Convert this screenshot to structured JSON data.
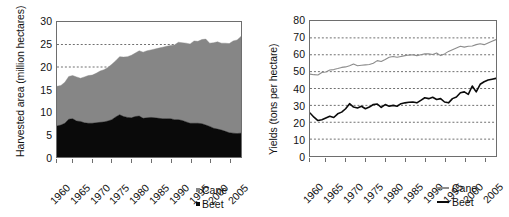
{
  "figure": {
    "panels": [
      {
        "id": "harvested-area",
        "ylabel": "Harvested area (million hectares)",
        "legend": [
          {
            "label": "Cane",
            "color": "#868686"
          },
          {
            "label": "Beet",
            "color": "#0a0a0a"
          }
        ]
      },
      {
        "id": "yields",
        "ylabel": "Yields (tons per hectare)",
        "legend": [
          {
            "label": "Cane",
            "color": "#8c8c8c"
          },
          {
            "label": "Beet",
            "color": "#0a0a0a"
          }
        ]
      }
    ]
  },
  "chart_data": [
    {
      "type": "area",
      "title": "",
      "stacked": true,
      "xlabel": "",
      "ylabel": "Harvested area (million hectares)",
      "ylim": [
        0,
        30
      ],
      "yticks": [
        0,
        5,
        10,
        15,
        20,
        25,
        30
      ],
      "gridlines": [
        20,
        25
      ],
      "grid": true,
      "xlim": [
        1961,
        2008
      ],
      "xticks": [
        1960,
        1965,
        1970,
        1975,
        1980,
        1985,
        1990,
        1995,
        2000,
        2005
      ],
      "legend_position": "bottom-right",
      "x": [
        1961,
        1962,
        1963,
        1964,
        1965,
        1966,
        1967,
        1968,
        1969,
        1970,
        1971,
        1972,
        1973,
        1974,
        1975,
        1976,
        1977,
        1978,
        1979,
        1980,
        1981,
        1982,
        1983,
        1984,
        1985,
        1986,
        1987,
        1988,
        1989,
        1990,
        1991,
        1992,
        1993,
        1994,
        1995,
        1996,
        1997,
        1998,
        1999,
        2000,
        2001,
        2002,
        2003,
        2004,
        2005,
        2006,
        2007,
        2008
      ],
      "series": [
        {
          "name": "Beet",
          "color": "#0a0a0a",
          "values": [
            6.9,
            7.1,
            7.5,
            8.4,
            8.5,
            8.0,
            7.9,
            7.6,
            7.5,
            7.5,
            7.6,
            7.7,
            7.8,
            8.0,
            8.3,
            8.9,
            9.4,
            9.0,
            8.8,
            8.7,
            9.0,
            9.1,
            8.6,
            8.7,
            8.8,
            8.7,
            8.6,
            8.5,
            8.5,
            8.5,
            8.3,
            8.3,
            8.1,
            7.8,
            7.5,
            7.5,
            7.5,
            7.4,
            7.1,
            6.8,
            6.4,
            6.2,
            6.0,
            5.7,
            5.4,
            5.3,
            5.2,
            5.3
          ]
        },
        {
          "name": "Cane",
          "color": "#868686",
          "values": [
            8.8,
            8.8,
            9.1,
            9.5,
            9.6,
            9.8,
            9.6,
            10.2,
            10.6,
            10.7,
            11.0,
            11.4,
            11.6,
            11.9,
            12.3,
            12.5,
            12.9,
            13.2,
            13.5,
            13.9,
            14.1,
            14.5,
            14.7,
            14.9,
            15.0,
            15.3,
            15.6,
            15.9,
            16.1,
            16.3,
            16.6,
            17.2,
            17.3,
            17.5,
            17.6,
            18.3,
            18.2,
            18.7,
            19.1,
            18.5,
            19.0,
            19.4,
            19.3,
            19.6,
            19.8,
            20.5,
            20.8,
            21.5
          ]
        }
      ]
    },
    {
      "type": "line",
      "title": "",
      "xlabel": "",
      "ylabel": "Yields (tons per hectare)",
      "ylim": [
        0,
        80
      ],
      "yticks": [
        0,
        10,
        20,
        30,
        40,
        50,
        60,
        70,
        80
      ],
      "gridlines": [
        10,
        20,
        30,
        40,
        50,
        60,
        70
      ],
      "grid": true,
      "xlim": [
        1961,
        2008
      ],
      "xticks": [
        1960,
        1965,
        1970,
        1975,
        1980,
        1985,
        1990,
        1995,
        2000,
        2005
      ],
      "legend_position": "bottom-right",
      "x": [
        1961,
        1962,
        1963,
        1964,
        1965,
        1966,
        1967,
        1968,
        1969,
        1970,
        1971,
        1972,
        1973,
        1974,
        1975,
        1976,
        1977,
        1978,
        1979,
        1980,
        1981,
        1982,
        1983,
        1984,
        1985,
        1986,
        1987,
        1988,
        1989,
        1990,
        1991,
        1992,
        1993,
        1994,
        1995,
        1996,
        1997,
        1998,
        1999,
        2000,
        2001,
        2002,
        2003,
        2004,
        2005,
        2006,
        2007,
        2008
      ],
      "series": [
        {
          "name": "Cane",
          "color": "#8c8c8c",
          "values": [
            48.5,
            48.2,
            48.0,
            49.5,
            49.8,
            51.0,
            51.2,
            51.8,
            52.5,
            52.8,
            53.5,
            54.5,
            53.5,
            53.8,
            54.0,
            54.2,
            55.0,
            56.5,
            56.0,
            57.2,
            58.5,
            59.0,
            58.5,
            59.0,
            59.5,
            59.8,
            60.0,
            59.5,
            60.0,
            60.5,
            60.5,
            60.2,
            61.0,
            59.5,
            60.5,
            62.0,
            63.0,
            64.0,
            65.0,
            64.5,
            65.0,
            65.2,
            66.0,
            66.5,
            66.0,
            67.0,
            68.0,
            69.0
          ]
        },
        {
          "name": "Beet",
          "color": "#0a0a0a",
          "values": [
            25.5,
            23.0,
            21.0,
            21.5,
            22.5,
            23.5,
            22.8,
            25.0,
            26.0,
            28.0,
            31.0,
            29.0,
            28.5,
            29.5,
            28.0,
            29.0,
            30.5,
            30.8,
            28.8,
            30.5,
            29.5,
            30.0,
            29.5,
            31.0,
            31.5,
            31.8,
            32.0,
            31.5,
            33.0,
            34.5,
            34.0,
            34.8,
            33.5,
            34.0,
            32.0,
            31.5,
            34.0,
            35.0,
            37.5,
            38.0,
            36.5,
            41.5,
            38.0,
            42.5,
            44.0,
            45.0,
            45.5,
            46.0
          ]
        }
      ]
    }
  ]
}
